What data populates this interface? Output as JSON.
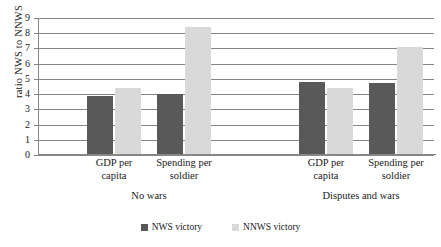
{
  "chart_data": {
    "type": "bar",
    "title": "",
    "xlabel": "",
    "ylabel": "ratio NWS to NNWS",
    "ylim": [
      0,
      9
    ],
    "ytick_step": 1,
    "grid": true,
    "legend_position": "bottom",
    "categories": [
      "GDP per capita",
      "Spending per soldier",
      "GDP per capita",
      "Spending per soldier"
    ],
    "panels": [
      "No wars",
      "Disputes and wars"
    ],
    "series": [
      {
        "name": "NWS victory",
        "color": "#595959",
        "values": [
          3.9,
          4.0,
          4.8,
          4.75
        ]
      },
      {
        "name": "NNWS victory",
        "color": "#d9d9d9",
        "values": [
          4.4,
          8.4,
          4.4,
          7.1
        ]
      }
    ],
    "yticks": [
      "9",
      "8",
      "7",
      "6",
      "5",
      "4",
      "3",
      "2",
      "1",
      "0"
    ]
  },
  "axis": {
    "y_title": "ratio NWS to NNWS"
  },
  "categories": [
    {
      "line1": "GDP per",
      "line2": "capita"
    },
    {
      "line1": "Spending per",
      "line2": "soldier"
    },
    {
      "line1": "GDP per",
      "line2": "capita"
    },
    {
      "line1": "Spending per",
      "line2": "soldier"
    }
  ],
  "panels": [
    {
      "label": "No wars"
    },
    {
      "label": "Disputes and wars"
    }
  ],
  "legend": [
    {
      "label": "NWS victory"
    },
    {
      "label": "NNWS victory"
    }
  ],
  "yticks": [
    {
      "v": "9"
    },
    {
      "v": "8"
    },
    {
      "v": "7"
    },
    {
      "v": "6"
    },
    {
      "v": "5"
    },
    {
      "v": "4"
    },
    {
      "v": "3"
    },
    {
      "v": "2"
    },
    {
      "v": "1"
    },
    {
      "v": "0"
    }
  ]
}
